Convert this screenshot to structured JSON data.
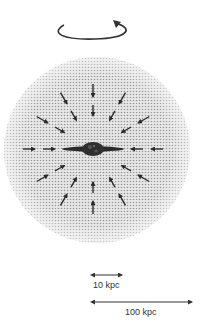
{
  "figure": {
    "halo": {
      "fill": "dotted gray",
      "color": "#bdbdbd"
    },
    "rotation_indicator": {
      "icon": "rotation-arrow-icon"
    },
    "galaxy": {
      "icon": "disk-galaxy-icon",
      "color": "#2a2a2a"
    },
    "inflow_arrows": {
      "icon": "arrow-icon",
      "count": 24,
      "direction": "inward"
    },
    "scale_bars": [
      {
        "label": "10 kpc",
        "relative_length": 1
      },
      {
        "label": "100 kpc",
        "relative_length": 3.2
      }
    ]
  }
}
